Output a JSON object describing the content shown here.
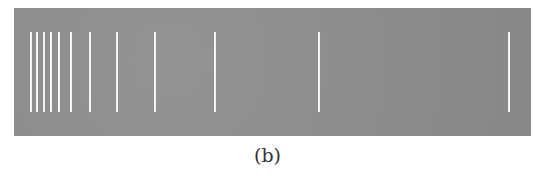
{
  "figure": {
    "caption": "(b)",
    "panel": {
      "background": "#8e8e8e",
      "line_color": "#f4f4f4"
    },
    "spectral_lines_x": [
      31,
      37,
      44,
      51,
      59,
      71,
      90,
      117,
      155,
      215,
      319,
      509
    ]
  }
}
